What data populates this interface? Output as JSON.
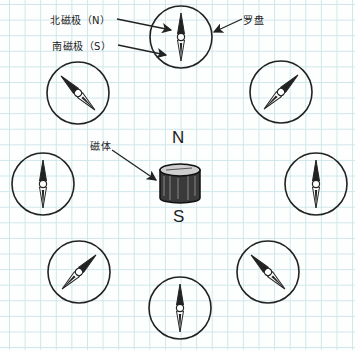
{
  "labels": {
    "north_pole": "北磁极（N）",
    "south_pole": "南磁极（S）",
    "compass": "罗盘",
    "magnet": "磁体",
    "magnet_n": "N",
    "magnet_s": "S"
  },
  "colors": {
    "grid": "#cfe7ea",
    "ink": "#222222",
    "paper": "#fdfefe"
  },
  "compasses": [
    {
      "id": "top",
      "cx": 181,
      "cy": 37,
      "r": 31,
      "north_angle": 0
    },
    {
      "id": "top-left",
      "cx": 78,
      "cy": 93,
      "r": 31,
      "north_angle": -45
    },
    {
      "id": "top-right",
      "cx": 281,
      "cy": 92,
      "r": 31,
      "north_angle": 45
    },
    {
      "id": "left",
      "cx": 43,
      "cy": 184,
      "r": 31,
      "north_angle": 0
    },
    {
      "id": "right",
      "cx": 316,
      "cy": 184,
      "r": 31,
      "north_angle": 0
    },
    {
      "id": "bottom-left",
      "cx": 79,
      "cy": 272,
      "r": 31,
      "north_angle": 45
    },
    {
      "id": "bottom-right",
      "cx": 268,
      "cy": 272,
      "r": 31,
      "north_angle": -45
    },
    {
      "id": "bottom",
      "cx": 180,
      "cy": 308,
      "r": 31,
      "north_angle": 0
    }
  ]
}
